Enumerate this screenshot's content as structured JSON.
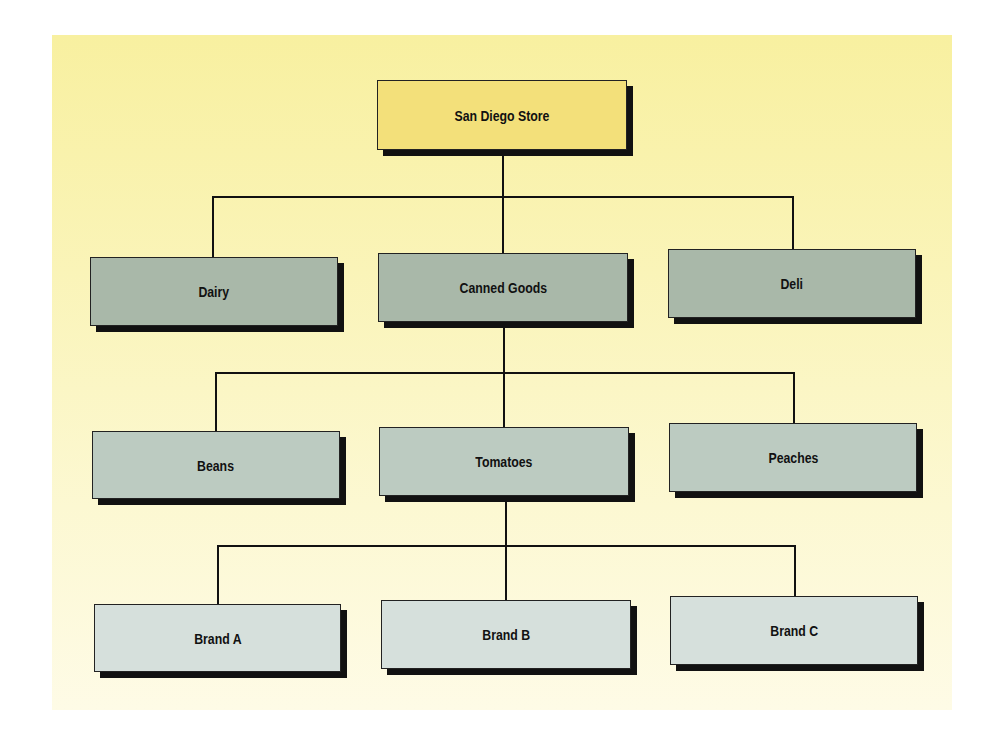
{
  "diagram": {
    "type": "org-chart-hierarchy",
    "root": {
      "label": "San Diego Store"
    },
    "level1": [
      {
        "label": "Dairy"
      },
      {
        "label": "Canned Goods"
      },
      {
        "label": "Deli"
      }
    ],
    "level2": [
      {
        "label": "Beans"
      },
      {
        "label": "Tomatoes"
      },
      {
        "label": "Peaches"
      }
    ],
    "level3": [
      {
        "label": "Brand A"
      },
      {
        "label": "Brand B"
      },
      {
        "label": "Brand C"
      }
    ],
    "edges": [
      [
        "San Diego Store",
        "Dairy"
      ],
      [
        "San Diego Store",
        "Canned Goods"
      ],
      [
        "San Diego Store",
        "Deli"
      ],
      [
        "Canned Goods",
        "Beans"
      ],
      [
        "Canned Goods",
        "Tomatoes"
      ],
      [
        "Canned Goods",
        "Peaches"
      ],
      [
        "Tomatoes",
        "Brand A"
      ],
      [
        "Tomatoes",
        "Brand B"
      ],
      [
        "Tomatoes",
        "Brand C"
      ]
    ],
    "colors": {
      "background": "#f8f0a0",
      "root_fill": "#f3e07a",
      "level1_fill": "#a9b8a9",
      "level2_fill": "#bccbc1",
      "level3_fill": "#d6e0dc",
      "shadow": "#111111"
    }
  }
}
